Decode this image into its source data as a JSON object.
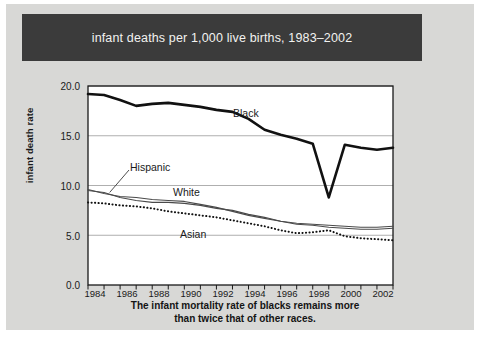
{
  "title": "infant deaths per 1,000 live births, 1983–2002",
  "caption_line1": "The infant mortality rate of blacks remains more",
  "caption_line2": "than twice that of other races.",
  "colors": {
    "card_background": "#d8d8d6",
    "titlebar_background": "#3b3b3b",
    "titlebar_text": "#f2f2f0",
    "plot_background": "#ffffff",
    "axis": "#1a1a1a",
    "gridline": "#9a9a9a",
    "black_series": "#111111",
    "hispanic_series": "#4a4a4a",
    "white_series": "#4a4a4a",
    "asian_series": "#111111"
  },
  "axes": {
    "y_title": "infant death rate",
    "y_ticks": [
      "20.0",
      "15.0",
      "10.0",
      "5.0",
      "0.0"
    ],
    "y_tick_values": [
      20.0,
      15.0,
      10.0,
      5.0,
      0.0
    ],
    "ylim": [
      0.0,
      20.0
    ],
    "x_ticks_all": [
      1983,
      1984,
      1985,
      1986,
      1987,
      1988,
      1989,
      1990,
      1991,
      1992,
      1993,
      1994,
      1995,
      1996,
      1997,
      1998,
      1999,
      2000,
      2001,
      2002
    ],
    "x_tick_labels": [
      "1984",
      "1986",
      "1988",
      "1990",
      "1992",
      "1994",
      "1996",
      "1998",
      "2000",
      "2002"
    ],
    "x_tick_label_values": [
      1984,
      1986,
      1988,
      1990,
      1992,
      1994,
      1996,
      1998,
      2000,
      2002
    ],
    "xlim": [
      1983,
      2002
    ],
    "grid": "horizontal"
  },
  "series_labels": {
    "black": "Black",
    "hispanic": "Hispanic",
    "white": "White",
    "asian": "Asian"
  },
  "chart_data": {
    "type": "line",
    "title": "infant deaths per 1,000 live births, 1983–2002",
    "xlabel": "",
    "ylabel": "infant death rate",
    "ylim": [
      0.0,
      20.0
    ],
    "xlim": [
      1983,
      2002
    ],
    "grid": true,
    "legend": "inline-labels",
    "x": [
      1983,
      1984,
      1985,
      1986,
      1987,
      1988,
      1989,
      1990,
      1991,
      1992,
      1993,
      1994,
      1995,
      1996,
      1997,
      1998,
      1999,
      2000,
      2001,
      2002
    ],
    "series": [
      {
        "name": "Black",
        "style": "thick-solid",
        "values": [
          19.2,
          19.1,
          18.6,
          18.0,
          18.2,
          18.3,
          18.1,
          17.9,
          17.6,
          17.4,
          16.7,
          15.6,
          15.1,
          14.7,
          14.2,
          8.8,
          14.1,
          13.8,
          13.6,
          13.8
        ]
      },
      {
        "name": "Hispanic",
        "style": "thin-solid",
        "values": [
          9.5,
          9.3,
          8.8,
          8.5,
          8.3,
          8.3,
          8.2,
          8.0,
          7.7,
          7.5,
          7.1,
          6.8,
          6.4,
          6.1,
          6.0,
          5.8,
          5.7,
          5.6,
          5.6,
          5.7
        ]
      },
      {
        "name": "White",
        "style": "thin-solid",
        "values": [
          9.6,
          9.2,
          8.9,
          8.8,
          8.6,
          8.5,
          8.4,
          8.1,
          7.8,
          7.4,
          7.0,
          6.7,
          6.4,
          6.2,
          6.1,
          6.0,
          5.9,
          5.8,
          5.8,
          5.9
        ]
      },
      {
        "name": "Asian",
        "style": "dotted",
        "values": [
          8.3,
          8.2,
          8.0,
          7.9,
          7.7,
          7.4,
          7.2,
          7.0,
          6.8,
          6.5,
          6.2,
          5.9,
          5.5,
          5.2,
          5.3,
          5.5,
          4.9,
          4.7,
          4.6,
          4.5
        ]
      }
    ]
  }
}
